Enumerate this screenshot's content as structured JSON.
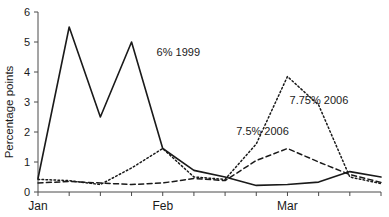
{
  "chart_data": {
    "type": "line",
    "title": "",
    "xlabel": "",
    "ylabel": "Percentage points",
    "ylim": [
      0,
      6
    ],
    "yticks": [
      0,
      1,
      2,
      3,
      4,
      5,
      6
    ],
    "ytick_labels": [
      "0",
      "1",
      "2",
      "3",
      "4",
      "5",
      "6"
    ],
    "grid": false,
    "legend_position": "inline-annotations",
    "xlim": [
      0,
      11
    ],
    "x_tick_positions": [
      0,
      1,
      2,
      3,
      4,
      5,
      6,
      7,
      8,
      9,
      10,
      11
    ],
    "x_category_labels": [
      {
        "label": "Jan",
        "x": 0
      },
      {
        "label": "Feb",
        "x": 4
      },
      {
        "label": "Mar",
        "x": 8
      }
    ],
    "x": [
      0,
      1,
      2,
      3,
      4,
      5,
      6,
      7,
      8,
      9,
      10,
      11
    ],
    "series": [
      {
        "name": "6% 1999",
        "style": "solid",
        "color": "#1a1a1a",
        "values": [
          0.45,
          5.5,
          2.5,
          5.0,
          1.45,
          0.72,
          0.5,
          0.22,
          0.25,
          0.33,
          0.68,
          0.5
        ],
        "annotation": {
          "text": "6% 1999",
          "x": 4.5,
          "y": 4.55
        }
      },
      {
        "name": "7.75% 2006",
        "style": "dotted",
        "color": "#1a1a1a",
        "values": [
          0.42,
          0.38,
          0.25,
          0.8,
          1.45,
          0.5,
          0.42,
          1.6,
          3.85,
          2.9,
          0.5,
          0.28
        ],
        "annotation": {
          "text": "7.75% 2006",
          "x": 9.95,
          "y": 2.95
        }
      },
      {
        "name": "7.5% 2006",
        "style": "dashed",
        "color": "#1a1a1a",
        "values": [
          0.3,
          0.35,
          0.3,
          0.25,
          0.3,
          0.45,
          0.38,
          1.05,
          1.45,
          1.0,
          0.58,
          0.32
        ],
        "annotation": {
          "text": "7.5% 2006",
          "x": 7.2,
          "y": 1.9
        }
      }
    ]
  },
  "axis": {
    "y_title": "Percentage points",
    "y_tick_0": "0",
    "y_tick_1": "1",
    "y_tick_2": "2",
    "y_tick_3": "3",
    "y_tick_4": "4",
    "y_tick_5": "5",
    "y_tick_6": "6",
    "x_label_jan": "Jan",
    "x_label_feb": "Feb",
    "x_label_mar": "Mar"
  },
  "annotations": {
    "solid": "6% 1999",
    "dotted": "7.75% 2006",
    "dashed": "7.5% 2006"
  },
  "colors": {
    "line": "#1a1a1a",
    "axis": "#4a4a4a",
    "background": "#ffffff"
  }
}
